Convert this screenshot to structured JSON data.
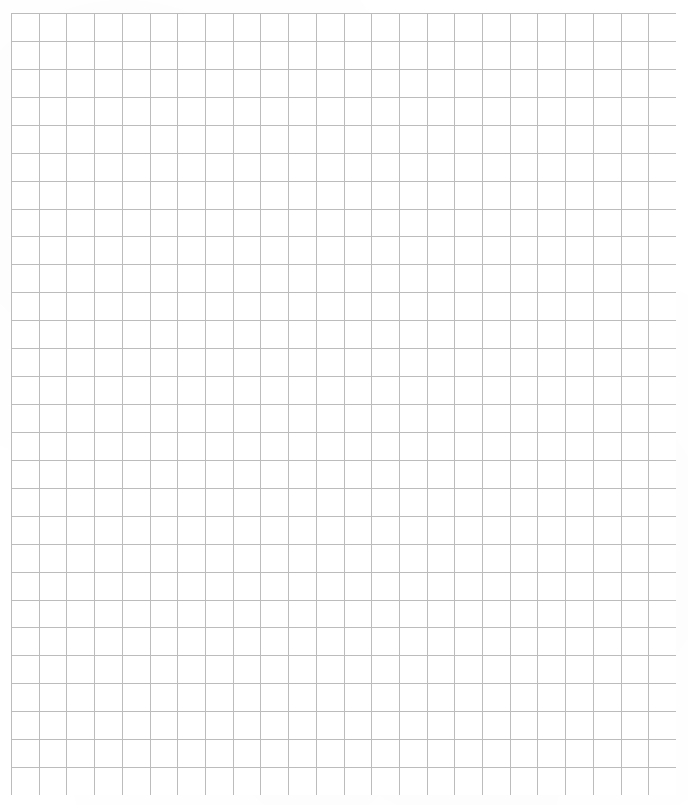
{
  "document": {
    "type": "graph-paper",
    "title": "Blank graph paper grid sheet",
    "page_width": 688,
    "page_height": 805,
    "background_color": "#ffffff",
    "content_text": ""
  },
  "grid": {
    "origin_x": 11,
    "origin_y": 13,
    "end_x": 676,
    "end_y": 795,
    "width": 665,
    "height": 782,
    "columns": 24,
    "rows": 28,
    "cell_width": 27.71,
    "cell_height": 27.93,
    "line_color": "#bcbcbc",
    "minor_line_color": "#cfcfcf",
    "line_width": 1,
    "major_lines": false,
    "labels": [],
    "annotations": []
  },
  "margins": {
    "left": 11,
    "top": 13,
    "right": 12,
    "bottom": 10
  },
  "chart_data": {
    "type": "table",
    "title": "",
    "xlabel": "",
    "ylabel": "",
    "categories": [],
    "values": [],
    "series": [],
    "grid": true,
    "legend": "none",
    "note": "Empty graph paper: uniform square grid, no plotted data"
  }
}
